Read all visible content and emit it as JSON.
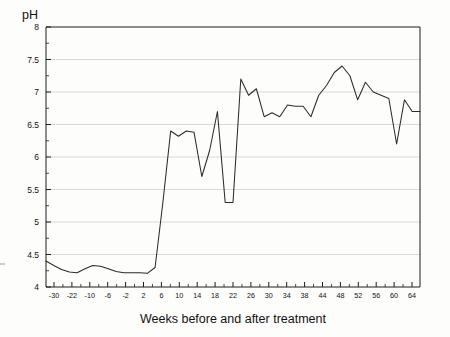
{
  "chart_data": {
    "type": "line",
    "title": "",
    "ylabel": "pH",
    "xlabel": "Weeks before and after treatment",
    "ylim": [
      4,
      8
    ],
    "y_ticks": [
      "4",
      "4.5",
      "5",
      "5.5",
      "6",
      "6.5",
      "7",
      "7.5",
      "8"
    ],
    "y_tick_values": [
      4,
      4.5,
      5,
      5.5,
      6,
      6.5,
      7,
      7.5,
      8
    ],
    "y_minor_step": 0.25,
    "grid": "horizontal",
    "legend": "none",
    "x_tick_labels": [
      "-30",
      "-22",
      "-10",
      "-6",
      "-2",
      "2",
      "6",
      "10",
      "14",
      "18",
      "22",
      "26",
      "30",
      "34",
      "38",
      "44",
      "48",
      "52",
      "56",
      "60",
      "64"
    ],
    "x_minor_between_major": 1,
    "x": [
      -30,
      -28,
      -26,
      -24,
      -22,
      -20,
      -18,
      -16,
      -14,
      -12,
      -10,
      -8,
      -6,
      -4,
      -2,
      0,
      2,
      4,
      6,
      8,
      10,
      12,
      14,
      16,
      18,
      20,
      22,
      24,
      26,
      28,
      30,
      32,
      34,
      36,
      38,
      40,
      42,
      44,
      46,
      48,
      50,
      52,
      54,
      56,
      58,
      60,
      62,
      64,
      66
    ],
    "values": [
      4.4,
      4.33,
      4.27,
      4.23,
      4.22,
      4.28,
      4.33,
      4.32,
      4.28,
      4.24,
      4.22,
      4.22,
      4.22,
      4.21,
      4.3,
      5.3,
      6.4,
      6.32,
      6.4,
      6.38,
      5.7,
      6.1,
      6.7,
      5.3,
      5.3,
      7.2,
      6.95,
      7.05,
      6.62,
      6.68,
      6.62,
      6.8,
      6.78,
      6.78,
      6.62,
      6.95,
      7.1,
      7.3,
      7.4,
      7.25,
      6.88,
      7.15,
      7.0,
      6.95,
      6.9,
      6.2,
      6.88,
      6.7,
      6.7
    ],
    "series": [
      {
        "name": "pH",
        "values": [
          4.4,
          4.33,
          4.27,
          4.23,
          4.22,
          4.28,
          4.33,
          4.32,
          4.28,
          4.24,
          4.22,
          4.22,
          4.22,
          4.21,
          4.3,
          5.3,
          6.4,
          6.32,
          6.4,
          6.38,
          5.7,
          6.1,
          6.7,
          5.3,
          5.3,
          7.2,
          6.95,
          7.05,
          6.62,
          6.68,
          6.62,
          6.8,
          6.78,
          6.78,
          6.62,
          6.95,
          7.1,
          7.3,
          7.4,
          7.25,
          6.88,
          7.15,
          7.0,
          6.95,
          6.9,
          6.2,
          6.88,
          6.7,
          6.7
        ]
      }
    ],
    "line_color": "#2b2b2b",
    "grid_color": "#c9c9c9",
    "axis_color": "#1c1c1c",
    "background_color": "#fdfdfb"
  }
}
